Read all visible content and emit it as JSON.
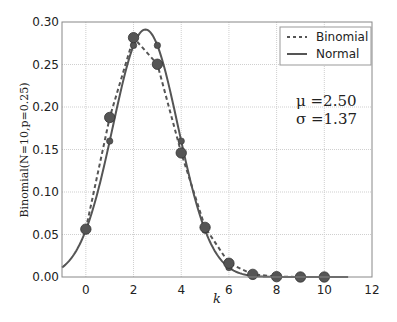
{
  "chart_data": {
    "type": "line",
    "title": "",
    "xlabel": "k",
    "ylabel": "Binomial(N=10,p=0.25)",
    "xlim": [
      -1,
      12
    ],
    "ylim": [
      0,
      0.3
    ],
    "xticks": [
      0,
      2,
      4,
      6,
      8,
      10,
      12
    ],
    "xtick_labels": [
      "0",
      "2",
      "4",
      "6",
      "8",
      "10",
      "12"
    ],
    "yticks": [
      0.0,
      0.05,
      0.1,
      0.15,
      0.2,
      0.25,
      0.3
    ],
    "ytick_labels": [
      "0.00",
      "0.05",
      "0.10",
      "0.15",
      "0.20",
      "0.25",
      "0.30"
    ],
    "grid": true,
    "legend_position": "upper right",
    "series": [
      {
        "name": "Binomial",
        "style": "dashed",
        "markers": "large",
        "x": [
          0,
          1,
          2,
          3,
          4,
          5,
          6,
          7,
          8,
          9,
          10
        ],
        "values": [
          0.0563,
          0.1877,
          0.2816,
          0.2503,
          0.146,
          0.0584,
          0.0162,
          0.0031,
          0.0004,
          0.0,
          0.0
        ]
      },
      {
        "name": "Normal",
        "style": "solid",
        "markers": "small-at-integers",
        "mu": 2.5,
        "sigma": 1.37,
        "x_range": [
          -1,
          11
        ],
        "marker_x": [
          0,
          1,
          2,
          3,
          4,
          5,
          6,
          7
        ],
        "marker_values": [
          0.055,
          0.1599,
          0.2725,
          0.2725,
          0.1599,
          0.055,
          0.0111,
          0.0013
        ]
      }
    ],
    "annotations": [
      "μ = 2.50",
      "σ = 1.37"
    ]
  },
  "legend": {
    "items": [
      {
        "label": "Binomial",
        "style": "dashed"
      },
      {
        "label": "Normal",
        "style": "solid"
      }
    ]
  },
  "colors": {
    "line": "#555555",
    "marker_fill": "#555555",
    "marker_edge": "#333333",
    "grid": "#cfcfcf",
    "axes": "#888888"
  },
  "labels": {
    "xlabel": "k",
    "ylabel": "Binomial(N=10,p=0.25)",
    "mu_text": "μ =2.50",
    "sigma_text": "σ =1.37"
  }
}
